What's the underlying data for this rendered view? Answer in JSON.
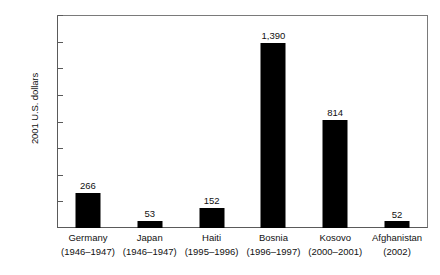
{
  "chart_data": {
    "type": "bar",
    "title": "",
    "xlabel": "",
    "ylabel": "2001 U.S. dollars",
    "ylim": [
      0,
      1600
    ],
    "grid": false,
    "legend": "none",
    "yticks": [
      0,
      200,
      400,
      600,
      800,
      1000,
      1200,
      1400,
      1600
    ],
    "ytick_labels": [
      "0",
      "200",
      "400",
      "600",
      "800",
      "1000",
      "1200",
      "1400",
      "1600"
    ],
    "categories": [
      "Germany",
      "Japan",
      "Haiti",
      "Bosnia",
      "Kosovo",
      "Afghanistan"
    ],
    "category_periods": [
      "(1946–1947)",
      "(1946–1947)",
      "(1995–1996)",
      "(1996–1997)",
      "(2000–2001)",
      "(2002)"
    ],
    "values": [
      266,
      53,
      152,
      1390,
      814,
      52
    ],
    "value_labels": [
      "266",
      "53",
      "152",
      "1,390",
      "814",
      "52"
    ],
    "bar_color": "#000000",
    "axis_color": "#5a5a5a",
    "background_color": "#ffffff"
  }
}
